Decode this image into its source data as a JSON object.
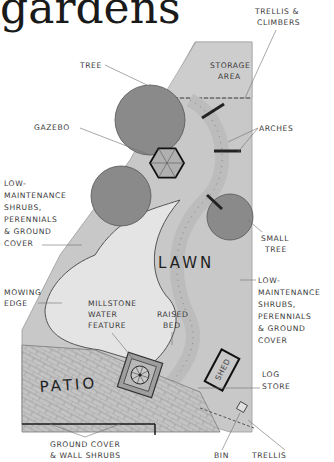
{
  "title": "gardens",
  "areas": {
    "lawn": "LAWN",
    "patio": "PATIO",
    "shed": "SHED",
    "storage": [
      "STORAGE",
      "AREA"
    ]
  },
  "labels": {
    "tree": "TREE",
    "trellis_climbers": [
      "TRELLIS &",
      "CLIMBERS"
    ],
    "gazebo": "GAZEBO",
    "arches": "ARCHES",
    "low_maintenance_left": [
      "LOW-",
      "MAINTENANCE",
      "SHRUBS,",
      "PERENNIALS",
      "& GROUND",
      "COVER"
    ],
    "small_tree": [
      "SMALL",
      "TREE"
    ],
    "low_maintenance_right": [
      "LOW-",
      "MAINTENANCE",
      "SHRUBS,",
      "PERENNIALS",
      "& GROUND",
      "COVER"
    ],
    "mowing_edge": [
      "MOWING",
      "EDGE"
    ],
    "millstone": [
      "MILLSTONE",
      "WATER",
      "FEATURE"
    ],
    "raised_bed": [
      "RAISED",
      "BED"
    ],
    "log_store": [
      "LOG",
      "STORE"
    ],
    "ground_cover": [
      "GROUND COVER",
      "& WALL SHRUBS"
    ],
    "bin": "BIN",
    "trellis": "TRELLIS"
  },
  "colors": {
    "plot_fill": "#c9c9c9",
    "lawn_fill": "#e6e6e6",
    "tree_fill": "#8a8a8a",
    "paving": "#bdbdbd",
    "outline": "#1a1a1a"
  }
}
